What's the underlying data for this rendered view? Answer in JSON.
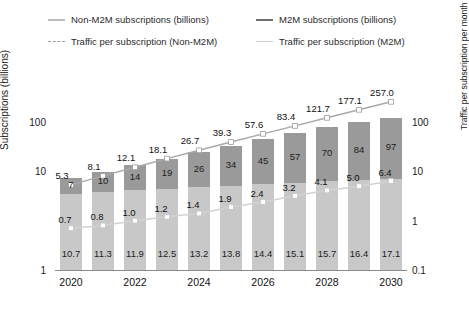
{
  "legend": {
    "items": [
      {
        "label": "Non-M2M subscriptions (billions)",
        "marker": "solid-light-line",
        "color": "#bdbdbd"
      },
      {
        "label": "M2M subscriptions (billions)",
        "marker": "solid-dark-line",
        "color": "#6f6f6f"
      },
      {
        "label": "Traffic per subscription (Non-M2M)",
        "marker": "dashed-line",
        "color": "#9d9d9d"
      },
      {
        "label": "Traffic per subscription (M2M)",
        "marker": "solid-pale-line",
        "color": "#cfcfcf"
      }
    ]
  },
  "axes": {
    "left_title": "Subscriptions (billions)",
    "right_title": "Traffic per subscription per month (GB)",
    "left_ticks": [
      "100",
      "10",
      "1"
    ],
    "right_ticks": [
      "100",
      "10",
      "1",
      "0.1"
    ],
    "x_ticks": [
      "2020",
      "2022",
      "2024",
      "2026",
      "2028",
      "2030"
    ]
  },
  "chart_data": {
    "type": "bar",
    "title": "",
    "xlabel": "",
    "ylabel": "Subscriptions (billions)",
    "y2label": "Traffic per subscription per month (GB)",
    "yscale": "log",
    "ylim": [
      1,
      100
    ],
    "y2lim": [
      0.1,
      100
    ],
    "grid": false,
    "legend_position": "top",
    "categories": [
      "2020",
      "2021",
      "2022",
      "2023",
      "2024",
      "2025",
      "2026",
      "2027",
      "2028",
      "2029",
      "2030"
    ],
    "series": [
      {
        "name": "Non-M2M subscriptions (billions)",
        "type": "bar-stack-bottom",
        "color": "#c8c8c8",
        "values": [
          10.7,
          11.3,
          11.9,
          12.5,
          13.2,
          13.8,
          14.4,
          15.1,
          15.7,
          16.4,
          17.1
        ]
      },
      {
        "name": "M2M subscriptions (billions)",
        "type": "bar-stack-top",
        "color": "#9a9a9a",
        "values": [
          7,
          10,
          14,
          19,
          26,
          34,
          45,
          57,
          70,
          84,
          97
        ]
      },
      {
        "name": "Traffic per subscription (Non-M2M)",
        "type": "line",
        "linestyle": "dashed",
        "color": "#9d9d9d",
        "axis": "right",
        "values": [
          5.3,
          8.1,
          12.1,
          18.1,
          26.7,
          39.3,
          57.6,
          83.4,
          121.7,
          177.1,
          257.0
        ]
      },
      {
        "name": "Traffic per subscription (M2M)",
        "type": "line",
        "linestyle": "solid",
        "color": "#cfcfcf",
        "axis": "right",
        "values": [
          0.7,
          0.8,
          1.0,
          1.2,
          1.4,
          1.9,
          2.4,
          3.2,
          4.1,
          5.0,
          6.4
        ]
      }
    ],
    "labels": {
      "traffic_nonm2m": [
        "5.3",
        "8.1",
        "12.1",
        "18.1",
        "26.7",
        "39.3",
        "57.6",
        "83.4",
        "121.7",
        "177.1",
        "257.0"
      ],
      "m2m_subs": [
        "7",
        "10",
        "14",
        "19",
        "26",
        "34",
        "45",
        "57",
        "70",
        "84",
        "97"
      ],
      "traffic_m2m": [
        "0.7",
        "0.8",
        "1.0",
        "1.2",
        "1.4",
        "1.9",
        "2.4",
        "3.2",
        "4.1",
        "5.0",
        "6.4"
      ],
      "nonm2m_subs": [
        "10.7",
        "11.3",
        "11.9",
        "12.5",
        "13.2",
        "13.8",
        "14.4",
        "15.1",
        "15.7",
        "16.4",
        "17.1"
      ]
    }
  }
}
